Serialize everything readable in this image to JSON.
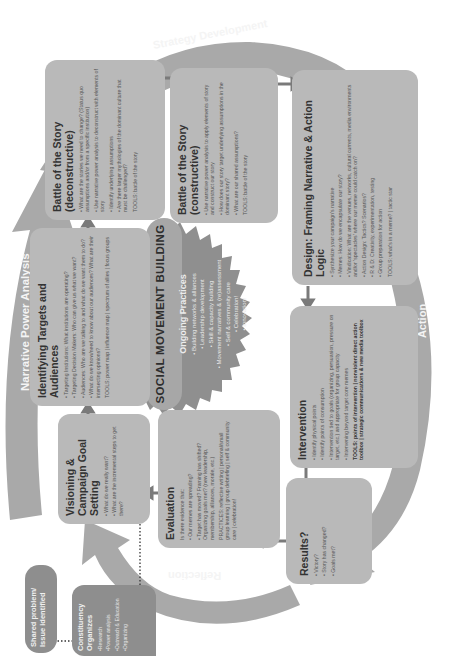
{
  "cycle_labels": {
    "top": "Strategy Development",
    "left": "Narrative Power Analysis",
    "right": "Action",
    "bottom": "Reflection"
  },
  "center": {
    "title": "SOCIAL MOVEMENT BUILDING",
    "subtitle": "Ongoing Practices",
    "items": [
      "Building networks & alliances",
      "Leadership development",
      "Skill & capacity building",
      "Movement narratives & (re)assessment",
      "Self & community care",
      "Celebration!",
      "Innovation!"
    ]
  },
  "boxes": {
    "battle_deconstructive": {
      "title": "Battle of the Story (deconstructive)",
      "items": [
        "What are the stories we need to change? (Status quo assumptions and/or from a specific institution)",
        "Use narrative power analysis to deconstruct with elements of story",
        "Identify underlying assumptions",
        "Are there larger mythologies of the dominant culture that must be challenged?"
      ],
      "tools": "TOOLS: battle of the story"
    },
    "battle_constructive": {
      "title": "Battle of the Story (constructive)",
      "items": [
        "Use narrative power analysis to apply elements of story and construct our story",
        "How does our story target underlying assumptions in the dominant story?",
        "What are our shared assumptions?"
      ],
      "tools": "TOOLS: battle of the story"
    },
    "design": {
      "title": "Design: Framing Narrative & Action Logic",
      "items": [
        "Synthesize your campaign's narrative",
        "Memes: How do we encapsulate our story?",
        "Vindication: What are the venues, networks, cultural currents, media environments and/or 'spectacles' where our meme could catch on?",
        "Action Design: Tactics? Scenarios?",
        "R & D: Creativity, experimentation, testing",
        "Group preparation for action"
      ],
      "tools": "TOOLS: what's in a meme? | tactic star"
    },
    "identifying": {
      "title": "Identifying Targets and Audiences",
      "items": [
        "Targeting Institutions: What institutions are operating?",
        "Targeting Decision Makers: Who can give us what we want?",
        "Audiences: Who are we talking to and what do we want them to do?",
        "What do we know/need to know about our audiences? What are their intersecting opinions?"
      ],
      "tools": "TOOLS: power map | influence map | spectrum of allies | focus groups"
    },
    "intervention": {
      "title": "Intervention",
      "items": [
        "Identify physical points",
        "Identify points of consumption",
        "Intervention tied to goals (organizing, persuasion, pressure on target, etc.) and appropriate for group capacity",
        "Intervening beyond target core memes"
      ],
      "tools": "TOOLS: points of intervention | nonviolent direct action toolbox | strategic communications & new media toolbox"
    },
    "visioning": {
      "title": "Visioning & Campaign Goal Setting",
      "items": [
        "What do we really want?",
        "What are the incremental steps to get there?"
      ]
    },
    "evaluation": {
      "title": "Evaluation",
      "intro": "Is there evidence that:",
      "items": [
        "Our memes are spreading?",
        "Target has moved? Framing has shifted? Organizing goals met? (new leadership, membership, alliances, morale, etc.)"
      ],
      "tools": "PRACTICES: reflective writing | personal/small group learning | group debriefing | self & community care | celebration!"
    },
    "results": {
      "title": "Results?",
      "items": [
        "Victory?",
        "Story has changed?",
        "Goals met?"
      ]
    },
    "shared_problem": {
      "title": "Shared problem/ Issue identified"
    },
    "constituency": {
      "title": "Constituency Organizes",
      "items": [
        "•Research",
        "•Power analysis",
        "•Outreach & Education",
        "•Organizing"
      ]
    }
  },
  "colors": {
    "box_fill": "#b9b9b9",
    "dark_box": "#8e8e8e",
    "arc": "#a9a9a9",
    "arrow": "#7a7a7a",
    "star": "#8f8f8f"
  }
}
